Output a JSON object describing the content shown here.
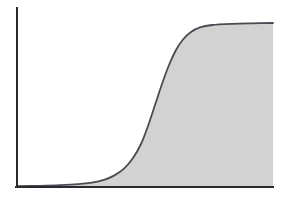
{
  "figure": {
    "title": "",
    "background_color": "#ffffff",
    "width": 283,
    "height": 200
  },
  "colors": {
    "background": "#ffffff",
    "axis": "#2a2a2e",
    "curve_stroke": "#4a4a52",
    "area_fill": "#d2d2d2"
  },
  "axes": {
    "y_axis": {
      "label": "",
      "x": 17,
      "y_top": 8,
      "y_bottom": 187,
      "stroke_width": 2,
      "ticks": [],
      "tick_labels": []
    },
    "x_axis": {
      "label": "",
      "y": 187,
      "x_left": 17,
      "x_right": 273,
      "stroke_width": 2,
      "ticks": [],
      "tick_labels": []
    }
  },
  "chart_data": {
    "type": "area",
    "title": "",
    "subtitle": "",
    "xlabel": "",
    "ylabel": "",
    "xlim": [
      0,
      1
    ],
    "ylim": [
      0,
      1
    ],
    "grid": false,
    "legend": null,
    "legend_position": "none",
    "annotations": [],
    "curve_shape": "sigmoid",
    "filled": true,
    "fill_color": "#d2d2d2",
    "line_color": "#4a4a52",
    "line_width": 1.8,
    "x": [
      0.0,
      0.05,
      0.1,
      0.15,
      0.2,
      0.25,
      0.3,
      0.35,
      0.4,
      0.45,
      0.5,
      0.55,
      0.6,
      0.65,
      0.7,
      0.75,
      0.8,
      0.85,
      0.9,
      0.95,
      1.0
    ],
    "values": [
      0.005,
      0.007,
      0.01,
      0.015,
      0.022,
      0.033,
      0.05,
      0.08,
      0.135,
      0.225,
      0.36,
      0.52,
      0.675,
      0.795,
      0.878,
      0.93,
      0.96,
      0.977,
      0.987,
      0.993,
      0.996
    ],
    "series": [
      {
        "name": "cumulative-response",
        "values": [
          0.005,
          0.007,
          0.01,
          0.015,
          0.022,
          0.033,
          0.05,
          0.08,
          0.135,
          0.225,
          0.36,
          0.52,
          0.675,
          0.795,
          0.878,
          0.93,
          0.96,
          0.977,
          0.987,
          0.993,
          0.996
        ]
      }
    ],
    "pixel_path": "M 17 186.2 L 40 185.8 L 60 185.2 L 78 184.2 L 92 182.6 L 104 179.8 L 114 175.6 L 124 168.6 L 133 158.0 L 141 144.0 L 148 126.0 L 155 105.0 L 162 84.0 L 169 65.0 L 176 50.0 L 183 39.5 L 191 32.0 L 200 27.4 L 212 25.0 L 232 23.8 L 252 23.3 L 273 23.0",
    "baseline_pixel_y": 187,
    "plateau_pixel_y": 23,
    "origin_pixel": [
      17,
      187
    ],
    "inflection_pixel": [
      148,
      105
    ]
  }
}
